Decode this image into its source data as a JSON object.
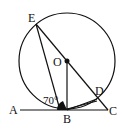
{
  "diagram": {
    "type": "circle-geometry",
    "circle": {
      "center": "O",
      "cx": 67,
      "cy": 61,
      "r": 48
    },
    "points": {
      "A": {
        "label": "A",
        "x": 20,
        "y": 110
      },
      "B": {
        "label": "B",
        "x": 67,
        "y": 110
      },
      "C": {
        "label": "C",
        "x": 108,
        "y": 110
      },
      "D": {
        "label": "D",
        "x": 97,
        "y": 99
      },
      "E": {
        "label": "E",
        "x": 36,
        "y": 24
      },
      "O": {
        "label": "O",
        "x": 67,
        "y": 61
      }
    },
    "segments": [
      "A-C",
      "E-B",
      "E-C",
      "O-B",
      "B-D"
    ],
    "angle": {
      "label": "70°",
      "vertex": "B",
      "between": [
        "A",
        "E"
      ]
    },
    "colors": {
      "stroke": "#111111",
      "background": "#ffffff"
    }
  }
}
